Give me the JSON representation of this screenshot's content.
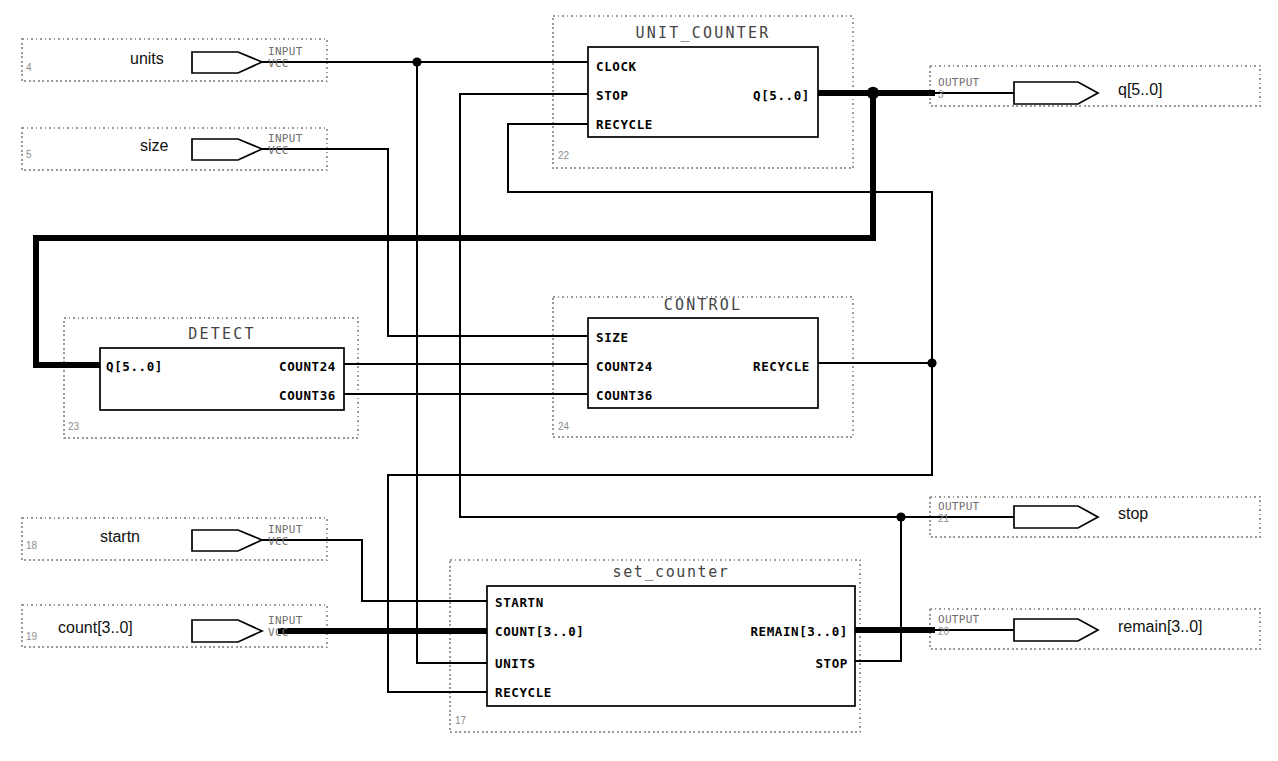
{
  "diagram": {
    "background": "#ffffff",
    "wire_color": "#000000",
    "selection_border_color": "#9a9a9a"
  },
  "pin_types": {
    "input_label": "INPUT",
    "input_sub": "VCC",
    "output_label": "OUTPUT"
  },
  "input_pins": [
    {
      "id": "4",
      "name": "units",
      "type": "INPUT",
      "sub": "VCC"
    },
    {
      "id": "5",
      "name": "size",
      "type": "INPUT",
      "sub": "VCC"
    },
    {
      "id": "18",
      "name": "startn",
      "type": "INPUT",
      "sub": "VCC"
    },
    {
      "id": "19",
      "name": "count[3..0]",
      "type": "INPUT",
      "sub": "VCC"
    }
  ],
  "output_pins": [
    {
      "id": "3",
      "name": "q[5..0]",
      "type": "OUTPUT"
    },
    {
      "id": "21",
      "name": "stop",
      "type": "OUTPUT"
    },
    {
      "id": "20",
      "name": "remain[3..0]",
      "type": "OUTPUT"
    }
  ],
  "blocks": [
    {
      "name": "UNIT_COUNTER",
      "instance": "22",
      "inputs": [
        "CLOCK",
        "STOP",
        "RECYCLE"
      ],
      "outputs": [
        "Q[5..0]"
      ]
    },
    {
      "name": "DETECT",
      "instance": "23",
      "inputs": [
        "Q[5..0]"
      ],
      "outputs": [
        "COUNT24",
        "COUNT36"
      ]
    },
    {
      "name": "CONTROL",
      "instance": "24",
      "inputs": [
        "SIZE",
        "COUNT24",
        "COUNT36"
      ],
      "outputs": [
        "RECYCLE"
      ]
    },
    {
      "name": "set_counter",
      "instance": "17",
      "inputs": [
        "STARTN",
        "COUNT[3..0]",
        "UNITS",
        "RECYCLE"
      ],
      "outputs": [
        "REMAIN[3..0]",
        "STOP"
      ]
    }
  ],
  "nets": [
    {
      "from": "units",
      "to": "UNIT_COUNTER.CLOCK",
      "bus": false
    },
    {
      "from": "units",
      "to": "set_counter.UNITS",
      "bus": false
    },
    {
      "from": "size",
      "to": "CONTROL.SIZE",
      "bus": false
    },
    {
      "from": "startn",
      "to": "set_counter.STARTN",
      "bus": false
    },
    {
      "from": "count[3..0]",
      "to": "set_counter.COUNT[3..0]",
      "bus": true
    },
    {
      "from": "UNIT_COUNTER.Q[5..0]",
      "to": "q[5..0]",
      "bus": true
    },
    {
      "from": "UNIT_COUNTER.Q[5..0]",
      "to": "DETECT.Q[5..0]",
      "bus": true
    },
    {
      "from": "DETECT.COUNT24",
      "to": "CONTROL.COUNT24",
      "bus": false
    },
    {
      "from": "DETECT.COUNT36",
      "to": "CONTROL.COUNT36",
      "bus": false
    },
    {
      "from": "CONTROL.RECYCLE",
      "to": "UNIT_COUNTER.RECYCLE",
      "bus": false
    },
    {
      "from": "CONTROL.RECYCLE",
      "to": "set_counter.RECYCLE",
      "bus": false
    },
    {
      "from": "set_counter.STOP",
      "to": "UNIT_COUNTER.STOP",
      "bus": false
    },
    {
      "from": "set_counter.STOP",
      "to": "stop",
      "bus": false
    },
    {
      "from": "set_counter.REMAIN[3..0]",
      "to": "remain[3..0]",
      "bus": true
    }
  ]
}
